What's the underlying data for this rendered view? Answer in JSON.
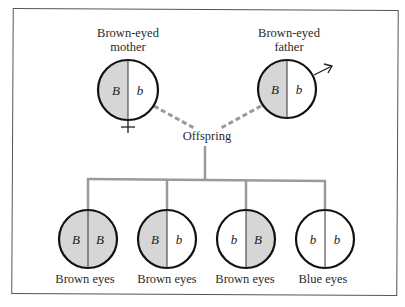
{
  "colors": {
    "dominant_fill": "#d6d6d6",
    "recessive_fill": "#ffffff",
    "outline": "#111111",
    "connector": "#9a9a9a"
  },
  "parents": {
    "mother": {
      "label_line1": "Brown-eyed",
      "label_line2": "mother",
      "alleles": [
        "B",
        "b"
      ],
      "symbol": "female-symbol"
    },
    "father": {
      "label_line1": "Brown-eyed",
      "label_line2": "father",
      "alleles": [
        "B",
        "b"
      ],
      "symbol": "male-symbol"
    }
  },
  "offspring_label": "Offspring",
  "offspring": [
    {
      "alleles": [
        "B",
        "B"
      ],
      "phenotype": "Brown eyes"
    },
    {
      "alleles": [
        "B",
        "b"
      ],
      "phenotype": "Brown eyes"
    },
    {
      "alleles": [
        "b",
        "B"
      ],
      "phenotype": "Brown eyes"
    },
    {
      "alleles": [
        "b",
        "b"
      ],
      "phenotype": "Blue eyes"
    }
  ]
}
